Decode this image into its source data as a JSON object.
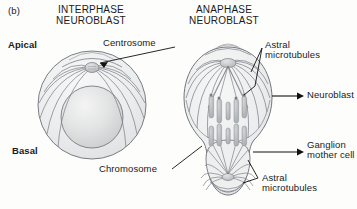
{
  "figure": {
    "panel_label": "(b)",
    "background_color": "#fdfdfc",
    "line_color": "#6b6f76",
    "text_color": "#1a1a1a",
    "cell_fill": "#e8e9ea",
    "nucleus_fill": "#dcdddd",
    "chromosome_fill": "#b9bbbd"
  },
  "titles": {
    "left_line1": "INTERPHASE",
    "left_line2": "NEUROBLAST",
    "right_line1": "ANAPHASE",
    "right_line2": "NEUROBLAST"
  },
  "axis_labels": {
    "apical": "Apical",
    "basal": "Basal"
  },
  "callouts": {
    "centrosome": "Centrosome",
    "astral_top_line1": "Astral",
    "astral_top_line2": "microtubules",
    "neuroblast": "Neuroblast",
    "ganglion_line1": "Ganglion",
    "ganglion_line2": "mother cell",
    "astral_bottom_line1": "Astral",
    "astral_bottom_line2": "microtubules",
    "chromosome": "Chromosome"
  }
}
